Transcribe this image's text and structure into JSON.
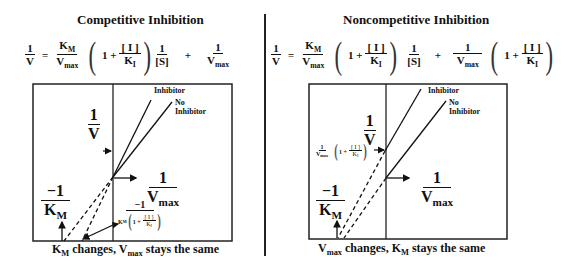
{
  "left": {
    "title": "Competitive Inhibition",
    "equation": {
      "lhs_num": "1",
      "lhs_den": "V",
      "equals": "=",
      "t1_num": "K",
      "t1_num_sub": "M",
      "t1_den": "V",
      "t1_den_sub": "max",
      "paren_one": "1 +",
      "paren_num": "[ I ]",
      "paren_den": "K",
      "paren_den_sub": "I",
      "s_num": "1",
      "s_den": "[S]",
      "plus": "+",
      "t2_num": "1",
      "t2_den": "V",
      "t2_den_sub": "max"
    },
    "graph": {
      "yaxis_num": "1",
      "yaxis_den": "V",
      "xint_num": "−1",
      "xint_den": "K",
      "xint_den_sub": "M",
      "yint_num": "1",
      "yint_den": "V",
      "yint_den_sub": "max",
      "inh_xint_num": "−1",
      "inh_xint_k": "K",
      "inh_xint_k_sub": "M",
      "inh_xint_paren": "1 +",
      "inh_xint_pnum": "[ I ]",
      "inh_xint_pden": "K",
      "inh_xint_pden_sub": "I",
      "line_inhibitor": "Inhibitor",
      "line_no_inhibitor_1": "No",
      "line_no_inhibitor_2": "Inhibitor"
    },
    "caption_a": "K",
    "caption_a_sub": "M",
    "caption_b": " changes, V",
    "caption_b_sub": "max",
    "caption_c": " stays the same"
  },
  "right": {
    "title": "Noncompetitive Inhibition",
    "equation": {
      "lhs_num": "1",
      "lhs_den": "V",
      "equals": "=",
      "t1_num": "K",
      "t1_num_sub": "M",
      "t1_den": "V",
      "t1_den_sub": "max",
      "paren_one": "1 +",
      "paren_num": "[ I ]",
      "paren_den": "K",
      "paren_den_sub": "I",
      "s_num": "1",
      "s_den": "[S]",
      "plus": "+",
      "t2_num": "1",
      "t2_den": "V",
      "t2_den_sub": "max",
      "paren2_one": "1 +",
      "paren2_num": "[ I ]",
      "paren2_den": "K",
      "paren2_den_sub": "I"
    },
    "graph": {
      "yaxis_num": "1",
      "yaxis_den": "V",
      "xint_num": "−1",
      "xint_den": "K",
      "xint_den_sub": "M",
      "yint_num": "1",
      "yint_den": "V",
      "yint_den_sub": "max",
      "inh_yint_num": "1",
      "inh_yint_den": "V",
      "inh_yint_den_sub": "max",
      "inh_yint_paren": "1 +",
      "inh_yint_pnum": "[ I ]",
      "inh_yint_pden": "K",
      "inh_yint_pden_sub": "I",
      "line_inhibitor": "Inhibitor",
      "line_no_inhibitor_1": "No",
      "line_no_inhibitor_2": "Inhibitor"
    },
    "caption_a": "V",
    "caption_a_sub": "max",
    "caption_b": " changes, K",
    "caption_b_sub": "M",
    "caption_c": " stays the same"
  }
}
